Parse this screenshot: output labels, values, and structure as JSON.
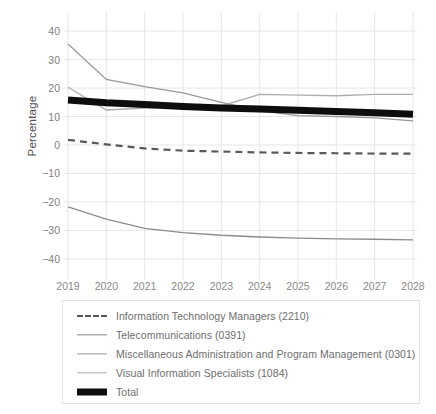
{
  "chart_data": {
    "type": "line",
    "title": "",
    "xlabel": "",
    "ylabel": "Percentage",
    "x": [
      2019,
      2020,
      2021,
      2022,
      2023,
      2024,
      2025,
      2026,
      2027,
      2028
    ],
    "xtick_labels": [
      "2019",
      "2020",
      "2021",
      "2022",
      "2023",
      "2024",
      "2025",
      "2026",
      "2027",
      "2028"
    ],
    "ytick_labels": [
      "40",
      "30",
      "20",
      "10",
      "0",
      "−10",
      "−20",
      "−30",
      "−40"
    ],
    "yticks": [
      40,
      30,
      20,
      10,
      0,
      -10,
      -20,
      -30,
      -40
    ],
    "ylim": [
      -44,
      44
    ],
    "xlim": [
      2018.7,
      2028.3
    ],
    "grid": true,
    "legend_position": "below-plot",
    "series": [
      {
        "name": "Information Technology Managers (2210)",
        "style": "dashed",
        "color": "#595959",
        "width": 2.2,
        "values": [
          1.8,
          0.2,
          -1.2,
          -2.0,
          -2.3,
          -2.6,
          -2.8,
          -2.9,
          -3.0,
          -3.0
        ]
      },
      {
        "name": "Telecommunications (0391)",
        "style": "solid",
        "color": "#8c8c8c",
        "width": 1.3,
        "values": [
          -21.7,
          -26.0,
          -29.3,
          -30.8,
          -31.7,
          -32.3,
          -32.7,
          -33.0,
          -33.1,
          -33.3
        ]
      },
      {
        "name": "Miscellaneous Administration and Program Management (0301)",
        "style": "solid",
        "color": "#999999",
        "width": 1.3,
        "values": [
          35.5,
          23.0,
          20.5,
          18.3,
          15.0,
          12.0,
          10.3,
          10.0,
          9.5,
          8.5
        ]
      },
      {
        "name": "Visual Information Specialists (1084)",
        "style": "solid",
        "color": "#adadad",
        "width": 1.3,
        "values": [
          20.3,
          12.3,
          13.0,
          13.3,
          13.7,
          17.8,
          17.5,
          17.3,
          17.8,
          17.8
        ]
      },
      {
        "name": "Total",
        "style": "solid",
        "color": "#0d0d0d",
        "width": 7,
        "values": [
          15.8,
          14.8,
          14.2,
          13.5,
          13.0,
          12.6,
          12.2,
          11.8,
          11.3,
          10.8
        ]
      }
    ]
  },
  "colors": {
    "background": "#ffffff",
    "grid": "#e6e6e6",
    "tick_text": "#808080",
    "axis_label": "#4d4d4d",
    "legend_border": "#e2e2e2",
    "legend_text": "#6e6e6e"
  }
}
